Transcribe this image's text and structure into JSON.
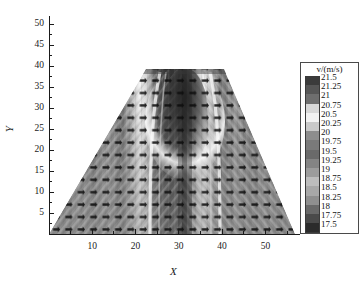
{
  "chart_data": {
    "type": "heatmap",
    "title": "",
    "xlabel": "X",
    "ylabel": "Y",
    "xlim": [
      0,
      58
    ],
    "ylim": [
      0,
      52
    ],
    "xticks": [
      10,
      20,
      30,
      40,
      50
    ],
    "yticks": [
      5,
      10,
      15,
      20,
      25,
      30,
      35,
      40,
      45,
      50
    ],
    "grid": false,
    "colormap": "grayscale",
    "colorbar": {
      "title": "v/(m/s)",
      "position": "right",
      "min": 17.5,
      "max": 21.5,
      "step": 0.25,
      "levels": [
        21.5,
        21.25,
        21,
        20.75,
        20.5,
        20.25,
        20,
        19.75,
        19.5,
        19.25,
        19,
        18.75,
        18.5,
        18.25,
        18,
        17.75,
        17.5
      ],
      "swatch_colors": [
        "#3b3b3b",
        "#565656",
        "#6e6e6e",
        "#d8d8d8",
        "#f2f2f2",
        "#c9c9c9",
        "#8d8d8d",
        "#7a7a7a",
        "#6a6a6a",
        "#848484",
        "#9c9c9c",
        "#bdbdbd",
        "#a8a8a8",
        "#8f8f8f",
        "#696969",
        "#4a4a4a",
        "#2b2b2b"
      ]
    },
    "domain": {
      "shape": "trapezoid",
      "top_y": 40,
      "bottom_y": 0,
      "top_x_left": 21,
      "top_x_right": 38,
      "bottom_x_left": 1,
      "bottom_x_right": 58
    },
    "overlay": {
      "type": "vector-field",
      "marker": "arrow",
      "grid_spacing_x": 2.2,
      "grid_spacing_y": 2.2
    },
    "features": [
      {
        "name": "core-low-velocity-band",
        "x_center": 30,
        "y_range": [
          24,
          40
        ],
        "value": 17.75
      },
      {
        "name": "high-velocity-shear-band-left",
        "x_center": 26,
        "y_range": [
          20,
          40
        ],
        "value": 20.75
      },
      {
        "name": "high-velocity-shear-band-right",
        "x_center": 34,
        "y_range": [
          20,
          40
        ],
        "value": 20.75
      }
    ]
  },
  "axes": {
    "x": {
      "label": "X",
      "ticks": [
        {
          "value": 10,
          "label": "10"
        },
        {
          "value": 20,
          "label": "20"
        },
        {
          "value": 30,
          "label": "30"
        },
        {
          "value": 40,
          "label": "40"
        },
        {
          "value": 50,
          "label": "50"
        }
      ]
    },
    "y": {
      "label": "Y",
      "ticks": [
        {
          "value": 5,
          "label": "5"
        },
        {
          "value": 10,
          "label": "10"
        },
        {
          "value": 15,
          "label": "15"
        },
        {
          "value": 20,
          "label": "20"
        },
        {
          "value": 25,
          "label": "25"
        },
        {
          "value": 30,
          "label": "30"
        },
        {
          "value": 35,
          "label": "35"
        },
        {
          "value": 40,
          "label": "40"
        },
        {
          "value": 45,
          "label": "45"
        },
        {
          "value": 50,
          "label": "50"
        }
      ]
    }
  },
  "legend": {
    "title": "v/(m/s)",
    "entries": [
      {
        "label": "21.5",
        "color": "#3b3b3b"
      },
      {
        "label": "21.25",
        "color": "#565656"
      },
      {
        "label": "21",
        "color": "#6e6e6e"
      },
      {
        "label": "20.75",
        "color": "#d8d8d8"
      },
      {
        "label": "20.5",
        "color": "#f2f2f2"
      },
      {
        "label": "20.25",
        "color": "#c9c9c9"
      },
      {
        "label": "20",
        "color": "#8d8d8d"
      },
      {
        "label": "19.75",
        "color": "#7a7a7a"
      },
      {
        "label": "19.5",
        "color": "#6a6a6a"
      },
      {
        "label": "19.25",
        "color": "#848484"
      },
      {
        "label": "19",
        "color": "#9c9c9c"
      },
      {
        "label": "18.75",
        "color": "#bdbdbd"
      },
      {
        "label": "18.5",
        "color": "#a8a8a8"
      },
      {
        "label": "18.25",
        "color": "#8f8f8f"
      },
      {
        "label": "18",
        "color": "#696969"
      },
      {
        "label": "17.75",
        "color": "#4a4a4a"
      },
      {
        "label": "17.5",
        "color": "#2b2b2b"
      }
    ]
  },
  "colors": {
    "axis": "#1a1a1a",
    "text": "#141414",
    "background": "#ffffff"
  }
}
